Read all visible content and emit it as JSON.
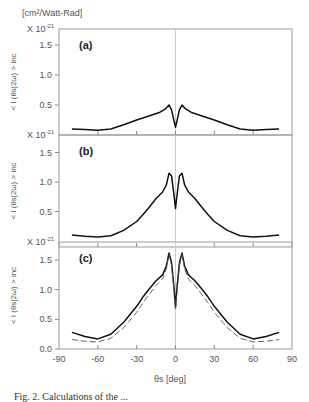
{
  "figure": {
    "units_label": "[cm²/Watt-Rad]",
    "ylabel": "< I (θs|2ω) > inc",
    "xlabel": "θs [deg]",
    "scale_label": "X 10",
    "scale_exp": "-21",
    "caption": "Fig. 2. Calculations of the ..."
  },
  "chart_data": [
    {
      "type": "line",
      "panel": "(a)",
      "title": "(a)",
      "xlabel": "θs [deg]",
      "ylabel": "< I (θs|2ω) > inc  [cm²/Watt-Rad] × 10^-21",
      "xlim": [
        -90,
        90
      ],
      "ylim": [
        0.0,
        1.75
      ],
      "yticks": [
        0.5,
        1.0,
        1.5
      ],
      "grid": false,
      "vline_at": 0,
      "series": [
        {
          "name": "solid",
          "style": "solid",
          "x": [
            -80,
            -70,
            -60,
            -50,
            -40,
            -30,
            -20,
            -12,
            -8,
            -5,
            -3,
            -1,
            0,
            1,
            3,
            5,
            8,
            12,
            20,
            30,
            40,
            50,
            60,
            70,
            80
          ],
          "y": [
            0.1,
            0.09,
            0.08,
            0.1,
            0.17,
            0.25,
            0.32,
            0.38,
            0.43,
            0.5,
            0.42,
            0.22,
            0.13,
            0.22,
            0.42,
            0.5,
            0.43,
            0.38,
            0.32,
            0.25,
            0.17,
            0.1,
            0.08,
            0.09,
            0.1
          ]
        }
      ]
    },
    {
      "type": "line",
      "panel": "(b)",
      "title": "(b)",
      "xlabel": "θs [deg]",
      "ylabel": "< I (θs|2ω) > inc  [cm²/Watt-Rad] × 10^-21",
      "xlim": [
        -90,
        90
      ],
      "ylim": [
        0.0,
        1.75
      ],
      "yticks": [
        0.5,
        1.0,
        1.5
      ],
      "grid": false,
      "vline_at": 0,
      "series": [
        {
          "name": "solid",
          "style": "solid",
          "x": [
            -80,
            -70,
            -60,
            -50,
            -40,
            -30,
            -25,
            -20,
            -15,
            -10,
            -7,
            -5,
            -3,
            -1,
            0,
            1,
            3,
            5,
            7,
            10,
            15,
            20,
            25,
            30,
            40,
            50,
            60,
            70,
            80
          ],
          "y": [
            0.1,
            0.08,
            0.07,
            0.09,
            0.18,
            0.33,
            0.45,
            0.58,
            0.72,
            0.83,
            0.95,
            1.15,
            1.1,
            0.75,
            0.55,
            0.75,
            1.1,
            1.15,
            0.95,
            0.83,
            0.72,
            0.58,
            0.45,
            0.33,
            0.18,
            0.09,
            0.07,
            0.08,
            0.1
          ]
        }
      ]
    },
    {
      "type": "line",
      "panel": "(c)",
      "title": "(c)",
      "xlabel": "θs [deg]",
      "ylabel": "< I (θs|2ω) > inc  [cm²/Watt-Rad] × 10^-21",
      "xlim": [
        -90,
        90
      ],
      "ylim": [
        0.0,
        1.8
      ],
      "yticks": [
        0.0,
        0.5,
        1.0,
        1.5
      ],
      "xticks": [
        -90,
        -60,
        -30,
        0,
        30,
        60,
        90
      ],
      "grid": false,
      "vline_at": 0,
      "series": [
        {
          "name": "solid",
          "style": "solid",
          "x": [
            -80,
            -70,
            -60,
            -50,
            -40,
            -30,
            -25,
            -20,
            -15,
            -10,
            -7,
            -5,
            -3,
            -1,
            0,
            1,
            3,
            5,
            7,
            10,
            15,
            20,
            25,
            30,
            40,
            50,
            60,
            70,
            80
          ],
          "y": [
            0.28,
            0.21,
            0.17,
            0.25,
            0.45,
            0.72,
            0.88,
            1.02,
            1.15,
            1.25,
            1.4,
            1.62,
            1.45,
            1.0,
            0.7,
            1.0,
            1.45,
            1.62,
            1.4,
            1.25,
            1.15,
            1.02,
            0.88,
            0.72,
            0.45,
            0.25,
            0.17,
            0.21,
            0.28
          ]
        },
        {
          "name": "dashed",
          "style": "dashed",
          "x": [
            -80,
            -70,
            -60,
            -50,
            -40,
            -30,
            -25,
            -20,
            -15,
            -10,
            -7,
            -5,
            -3,
            -1,
            0,
            1,
            3,
            5,
            7,
            10,
            15,
            20,
            25,
            30,
            40,
            50,
            60,
            70,
            80
          ],
          "y": [
            0.16,
            0.13,
            0.12,
            0.18,
            0.36,
            0.62,
            0.78,
            0.93,
            1.07,
            1.18,
            1.35,
            1.6,
            1.4,
            0.95,
            0.68,
            0.95,
            1.4,
            1.6,
            1.35,
            1.18,
            1.07,
            0.93,
            0.78,
            0.62,
            0.36,
            0.18,
            0.12,
            0.13,
            0.16
          ]
        }
      ]
    }
  ]
}
